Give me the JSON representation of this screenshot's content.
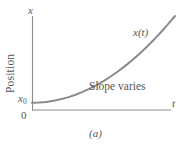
{
  "figure": {
    "caption": "(a)",
    "background_color": "#ffffff",
    "curve_color": "#8a8a8a",
    "axis_color": "#8c8c8c",
    "text_color": "#555555"
  },
  "axes": {
    "y_axis_name": "x",
    "y_axis_title": "Position",
    "x_axis_name": "t",
    "origin_label": "0",
    "intercept_label": "x",
    "intercept_subscript": "0"
  },
  "annotations": {
    "curve_label": "x(t)",
    "slope_note": "Slope varies"
  },
  "chart_data": {
    "type": "line",
    "title": "",
    "subtitle": "",
    "xlabel": "t",
    "ylabel": "Position",
    "xlim": [
      0,
      10
    ],
    "ylim": [
      0,
      10
    ],
    "grid": false,
    "legend": "none",
    "tick_labels": {
      "x": [
        "0"
      ],
      "y": [
        "x0"
      ]
    },
    "series": [
      {
        "name": "x(t)",
        "x": [
          0.0,
          0.5,
          1.0,
          1.5,
          2.0,
          2.5,
          3.0,
          3.5,
          4.0,
          4.5,
          5.0,
          5.5,
          6.0,
          6.5,
          7.0,
          7.5,
          8.0,
          8.5,
          9.0,
          9.5,
          10.0
        ],
        "y": [
          1.0,
          1.03,
          1.12,
          1.27,
          1.48,
          1.75,
          2.08,
          2.47,
          2.92,
          3.43,
          4.0,
          4.63,
          5.32,
          6.07,
          6.88,
          7.75,
          8.68,
          9.67,
          10.72,
          11.83,
          13.0
        ]
      }
    ],
    "annotations": [
      {
        "text": "x(t)",
        "x": 8.1,
        "y": 11.0
      },
      {
        "text": "Slope varies",
        "x": 5.0,
        "y": 2.6
      }
    ]
  }
}
